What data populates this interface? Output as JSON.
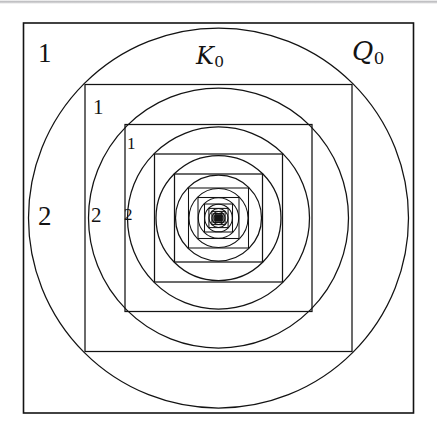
{
  "figure": {
    "background_color": "#ffffff",
    "stroke_color": "#131313",
    "canvas": {
      "width": 437,
      "height": 439
    },
    "center": {
      "x": 218.5,
      "y": 218.0
    },
    "artifact": {
      "name": "scan-line",
      "y": 2
    }
  },
  "labels": {
    "outer_square": {
      "text": "Q",
      "subscript": "0",
      "x": 352,
      "y": 38,
      "font_size": 26
    },
    "outer_circle": {
      "text": "K",
      "subscript": "0",
      "x": 196,
      "y": 44,
      "font_size": 24
    },
    "region_1_a": {
      "text": "1",
      "x": 38,
      "y": 40,
      "font_size": 27
    },
    "region_1_b": {
      "text": "1",
      "x": 93,
      "y": 97,
      "font_size": 21
    },
    "region_1_c": {
      "text": "1",
      "x": 127,
      "y": 135,
      "font_size": 17
    },
    "region_2_a": {
      "text": "2",
      "x": 38,
      "y": 203,
      "font_size": 27
    },
    "region_2_b": {
      "text": "2",
      "x": 91,
      "y": 205,
      "font_size": 21
    },
    "region_2_c": {
      "text": "2",
      "x": 124,
      "y": 206,
      "font_size": 17
    }
  },
  "chart_data": {
    "type": "diagram",
    "center": [
      218.5,
      218.0
    ],
    "squares": [
      {
        "index": 0,
        "half_width": 195.0,
        "left": 23.5,
        "top": 23.0,
        "right": 413.5,
        "bottom": 413.0,
        "label": "Q0"
      },
      {
        "index": 1,
        "half_width": 133.5,
        "left": 85.0,
        "top": 84.5,
        "right": 352.0,
        "bottom": 351.5
      },
      {
        "index": 2,
        "half_width": 93.5,
        "left": 125.0,
        "top": 124.5,
        "right": 312.0,
        "bottom": 311.5
      },
      {
        "index": 3,
        "half_width": 64.0,
        "left": 154.5,
        "top": 154.0,
        "right": 282.5,
        "bottom": 282.0
      },
      {
        "index": 4,
        "half_width": 44.0,
        "left": 174.5,
        "top": 174.0,
        "right": 262.5,
        "bottom": 262.0
      },
      {
        "index": 5,
        "half_width": 30.0,
        "left": 188.5,
        "top": 188.0,
        "right": 248.5,
        "bottom": 248.0
      },
      {
        "index": 6,
        "half_width": 20.5,
        "left": 198.0,
        "top": 197.5,
        "right": 239.0,
        "bottom": 238.5
      },
      {
        "index": 7,
        "half_width": 14.0,
        "left": 204.5,
        "top": 204.0,
        "right": 232.5,
        "bottom": 232.0
      },
      {
        "index": 8,
        "half_width": 9.6,
        "left": 208.9,
        "top": 208.4,
        "right": 228.1,
        "bottom": 227.6
      },
      {
        "index": 9,
        "half_width": 6.6,
        "left": 211.9,
        "top": 211.4,
        "right": 225.1,
        "bottom": 224.6
      },
      {
        "index": 10,
        "half_width": 4.5,
        "left": 214.0,
        "top": 213.5,
        "right": 223.0,
        "bottom": 222.5
      },
      {
        "index": 11,
        "half_width": 3.1,
        "left": 215.4,
        "top": 214.9,
        "right": 221.6,
        "bottom": 221.1
      },
      {
        "index": 12,
        "half_width": 2.1,
        "left": 216.4,
        "top": 215.9,
        "right": 220.6,
        "bottom": 220.1
      }
    ],
    "circles": [
      {
        "index": 0,
        "radius": 190.0,
        "label": "K0"
      },
      {
        "index": 1,
        "radius": 130.0
      },
      {
        "index": 2,
        "radius": 91.0
      },
      {
        "index": 3,
        "radius": 62.5
      },
      {
        "index": 4,
        "radius": 43.0
      },
      {
        "index": 5,
        "radius": 29.5
      },
      {
        "index": 6,
        "radius": 20.2
      },
      {
        "index": 7,
        "radius": 13.8
      },
      {
        "index": 8,
        "radius": 9.5
      },
      {
        "index": 9,
        "radius": 6.5
      },
      {
        "index": 10,
        "radius": 4.4
      },
      {
        "index": 11,
        "radius": 3.0
      },
      {
        "index": 12,
        "radius": 2.0
      }
    ],
    "region_labels": [
      "1",
      "2",
      "1",
      "2",
      "1",
      "2"
    ],
    "legend": "none",
    "grid": false
  }
}
